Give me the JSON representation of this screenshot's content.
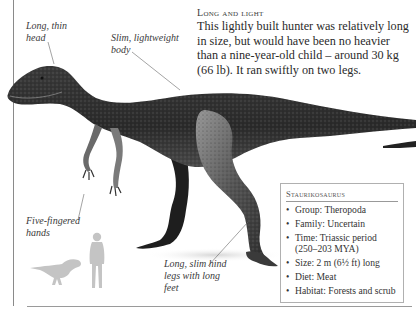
{
  "intro": {
    "title": "Long and light",
    "body": "This lightly built hunter was relatively long in size, but would have been no heavier than a nine-year-old child – around 30 kg (66 lb). It ran swiftly on two legs."
  },
  "labels": {
    "head": "Long, thin head",
    "body": "Slim, lightweight body",
    "hands": "Five-fingered hands",
    "legs": "Long, slim hind legs with long feet"
  },
  "factbox": {
    "title": "Staurikosaurus",
    "facts": [
      "Group: Theropoda",
      "Family: Uncertain",
      "Time: Triassic period (250–203 MYA)",
      "Size: 2 m (6½ ft) long",
      "Diet: Meat",
      "Habitat: Forests and scrub"
    ]
  },
  "scale": {
    "human_icon": "human-silhouette",
    "dino_icon": "dinosaur-silhouette"
  },
  "colors": {
    "dino_dark": "#2b2b2b",
    "dino_mid": "#5a5a5a",
    "silhouette": "#c4c4c4",
    "rule": "#9a9a9a"
  }
}
